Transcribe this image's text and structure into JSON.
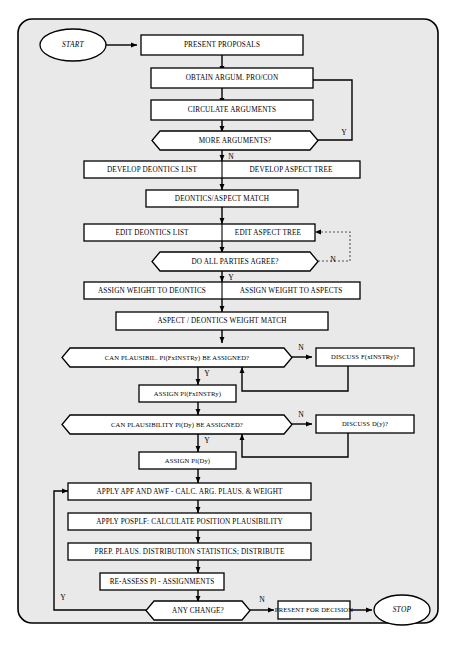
{
  "diagram": {
    "frame": {
      "fill": "#e9e9e9",
      "stroke": "#000000"
    },
    "nodes": {
      "start": {
        "label": "START",
        "shape": "ellipse"
      },
      "present_proposals": {
        "label": "PRESENT PROPOSALS",
        "shape": "process"
      },
      "obtain_argum": {
        "label": "OBTAIN ARGUM. PRO/CON",
        "shape": "process"
      },
      "circulate_arguments": {
        "label": "CIRCULATE ARGUMENTS",
        "shape": "process"
      },
      "more_arguments": {
        "label": "MORE ARGUMENTS?",
        "shape": "decision"
      },
      "develop_deontics_list": {
        "label": "DEVELOP DEONTICS LIST",
        "shape": "process-split-left"
      },
      "develop_aspect_tree": {
        "label": "DEVELOP ASPECT TREE",
        "shape": "process-split-right"
      },
      "deontics_aspect_match": {
        "label": "DEONTICS/ASPECT MATCH",
        "shape": "process"
      },
      "edit_deontics_list": {
        "label": "EDIT DEONTICS LIST",
        "shape": "process-split-left"
      },
      "edit_aspect_tree": {
        "label": "EDIT ASPECT TREE",
        "shape": "process-split-right"
      },
      "do_all_parties_agree": {
        "label": "DO ALL PARTIES AGREE?",
        "shape": "decision"
      },
      "assign_weight_deontics": {
        "label": "ASSIGN WEIGHT TO DEONTICS",
        "shape": "process-split-left"
      },
      "assign_weight_aspects": {
        "label": "ASSIGN WEIGHT TO ASPECTS",
        "shape": "process-split-right"
      },
      "aspect_deontics_weight_match": {
        "label": "ASPECT / DEONTICS WEIGHT MATCH",
        "shape": "process"
      },
      "can_plausibil_f": {
        "label": "CAN PLAUSIBIL. Pl(FxINSTRy)  BE ASSIGNED?",
        "shape": "decision"
      },
      "discuss_f": {
        "label": "DISCUSS   F(xINSTRy)?",
        "shape": "process"
      },
      "assign_pl_f": {
        "label": "ASSIGN Pl(FxINSTRy)",
        "shape": "process"
      },
      "can_plausibility_d": {
        "label": "CAN PLAUSIBILITY  Pl(Dy)  BE ASSIGNED?",
        "shape": "decision"
      },
      "discuss_d": {
        "label": "DISCUSS   D(y)?",
        "shape": "process"
      },
      "assign_pl_d": {
        "label": "ASSIGN Pl(Dy)",
        "shape": "process"
      },
      "apply_apf_awf": {
        "label": "APPLY  APF AND AWF - CALC. ARG. PLAUS. & WEIGHT",
        "shape": "process"
      },
      "apply_posplf": {
        "label": "APPLY POSPLF:  CALCULATE  POSITION PLAUSIBILITY",
        "shape": "process"
      },
      "prep_plaus": {
        "label": "PREP.  PLAUS.  DISTRIBUTION  STATISTICS;  DISTRIBUTE",
        "shape": "process"
      },
      "reassess_pl": {
        "label": "RE-ASSESS Pl - ASSIGNMENTS",
        "shape": "process"
      },
      "any_change": {
        "label": "ANY CHANGE?",
        "shape": "decision"
      },
      "present_for_decision": {
        "label": "PRESENT FOR DECISION",
        "shape": "process"
      },
      "stop": {
        "label": "STOP",
        "shape": "ellipse"
      }
    },
    "branch_labels": {
      "more_arguments_yes": "Y",
      "more_arguments_no": "N",
      "parties_agree_yes": "Y",
      "parties_agree_no": "N",
      "plaus_f_yes": "Y",
      "plaus_f_no": "N",
      "plaus_d_yes": "Y",
      "plaus_d_no": "N",
      "any_change_yes": "Y",
      "any_change_no": "N"
    }
  }
}
